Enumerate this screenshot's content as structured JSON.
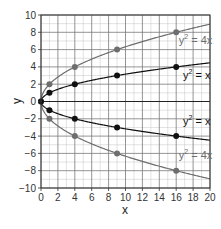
{
  "chart_data": {
    "type": "line",
    "title": "",
    "xlabel": "x",
    "ylabel": "y",
    "xlim": [
      0,
      20
    ],
    "ylim": [
      -10,
      10
    ],
    "grid": true,
    "x_ticks": [
      0,
      2,
      4,
      6,
      8,
      10,
      12,
      14,
      16,
      18,
      20
    ],
    "y_ticks": [
      -10,
      -8,
      -6,
      -4,
      -2,
      0,
      2,
      4,
      6,
      8,
      10
    ],
    "series": [
      {
        "name": "y^2 = 4x",
        "color": "#6e6e6e",
        "equation_coef": 4,
        "points": [
          [
            0,
            0
          ],
          [
            1,
            2
          ],
          [
            4,
            4
          ],
          [
            9,
            6
          ],
          [
            16,
            8
          ],
          [
            1,
            -2
          ],
          [
            4,
            -4
          ],
          [
            9,
            -6
          ],
          [
            16,
            -8
          ]
        ],
        "labels": [
          {
            "text": "y",
            "sup": "2",
            "rest": " = 4x",
            "x": 16.3,
            "y": 6.6
          },
          {
            "text": "y",
            "sup": "2",
            "rest": " = 4x",
            "x": 16.3,
            "y": -6.7
          }
        ]
      },
      {
        "name": "y^2 = x",
        "color": "#111111",
        "equation_coef": 1,
        "points": [
          [
            0,
            0
          ],
          [
            1,
            1
          ],
          [
            4,
            2
          ],
          [
            9,
            3
          ],
          [
            16,
            4
          ],
          [
            1,
            -1
          ],
          [
            4,
            -2
          ],
          [
            9,
            -3
          ],
          [
            16,
            -4
          ]
        ],
        "labels": [
          {
            "text": "y",
            "sup": "2",
            "rest": " = x",
            "x": 16.8,
            "y": 2.6
          },
          {
            "text": "y",
            "sup": "2",
            "rest": " = x",
            "x": 16.8,
            "y": -2.7
          }
        ]
      }
    ],
    "legend": "inline labels on right"
  },
  "colors": {
    "major_grid": "#7a7a7a",
    "minor_grid": "#c4c4c4",
    "axis": "#333333"
  }
}
